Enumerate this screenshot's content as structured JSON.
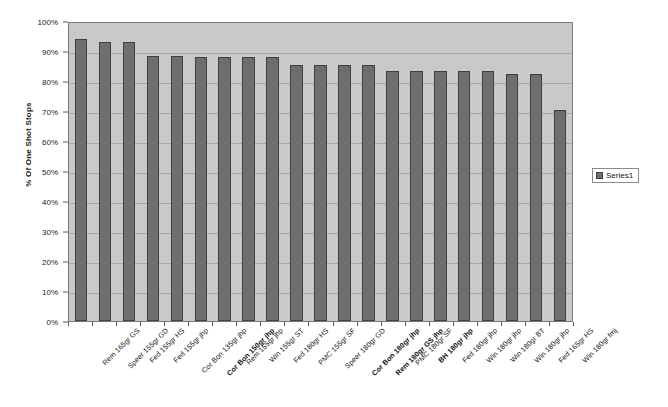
{
  "chart_data": {
    "type": "bar",
    "title": "",
    "subtitle": "",
    "xlabel": "",
    "ylabel": "% Of One Shot Stops",
    "ylim": [
      0,
      1.0
    ],
    "ytick_labels": [
      "100%",
      "90%",
      "80%",
      "70%",
      "60%",
      "50%",
      "40%",
      "30%",
      "20%",
      "10%",
      "0%"
    ],
    "ytick_values": [
      1.0,
      0.9,
      0.8,
      0.7,
      0.6,
      0.5,
      0.4,
      0.3,
      0.2,
      0.1,
      0.0
    ],
    "grid": true,
    "legend_position": "right",
    "categories": [
      "Rem 165gr GS",
      "Speer 155gr GD",
      "Fed 155gr HS",
      "Fed 155gr jhp",
      "Cor Bon 135gr jhp",
      "Cor Bon 150gr jhp",
      "Rem 155gr jhp",
      "Win 155gr ST",
      "Fed 180gr HS",
      "PMC 155gr SF",
      "Speer 180gr GD",
      "Cor Bon 180gr jhp",
      "Rem 180gr GS jhp",
      "PMC 180gr SF",
      "BH 180gr jhp",
      "Fed 180gr jhp",
      "Win 180gr jhp",
      "Win 180gr BT",
      "Win 180gr jhp",
      "Fed 165gr HS",
      "Win 180gr fmj"
    ],
    "category_bold": [
      false,
      false,
      false,
      false,
      false,
      true,
      false,
      false,
      false,
      false,
      false,
      true,
      true,
      false,
      true,
      false,
      false,
      false,
      false,
      false,
      false
    ],
    "series": [
      {
        "name": "Series1",
        "values": [
          0.94,
          0.93,
          0.93,
          0.885,
          0.885,
          0.88,
          0.88,
          0.88,
          0.88,
          0.855,
          0.855,
          0.855,
          0.855,
          0.835,
          0.835,
          0.835,
          0.835,
          0.835,
          0.825,
          0.825,
          0.705
        ]
      }
    ]
  },
  "legend": {
    "series_label": "Series1",
    "swatch_color": "#6e6e6e"
  },
  "axis": {
    "y_title": "% Of One Shot Stops"
  },
  "colors": {
    "bar_fill": "#6e6e6e",
    "bar_border": "#404040",
    "plot_background": "#c9c9c9",
    "gridline": "#a8a8a8",
    "text": "#141414"
  }
}
